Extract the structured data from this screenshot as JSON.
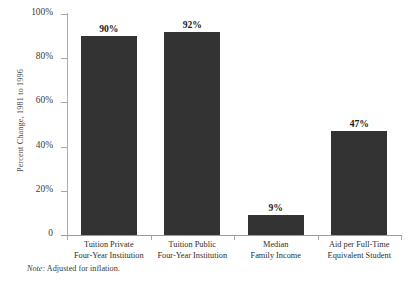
{
  "chart_data": {
    "type": "bar",
    "title": "",
    "subtitle": "",
    "xlabel": "",
    "ylabel": "Percent Change, 1981 to 1996",
    "ylim": [
      0,
      100
    ],
    "grid": false,
    "legend": false,
    "bar_color": "#333333",
    "axis_color": "#9a9a9a",
    "categories": [
      "Tuition Private Four-Year Institution",
      "Tuition Public Four-Year Institution",
      "Median Family Income",
      "Aid per Full-Time Equivalent Student"
    ],
    "category_lines": [
      [
        "Tuition Private",
        "Four-Year Institution"
      ],
      [
        "Tuition Public",
        "Four-Year Institution"
      ],
      [
        "Median",
        "Family Income"
      ],
      [
        "Aid per Full-Time",
        "Equivalent Student"
      ]
    ],
    "values": [
      90,
      92,
      9,
      47
    ],
    "value_labels": [
      "90%",
      "92%",
      "9%",
      "47%"
    ],
    "yticks": [
      0,
      20,
      40,
      60,
      80,
      100
    ],
    "ytick_labels": [
      "0",
      "20%",
      "40%",
      "60%",
      "80%",
      "100%"
    ]
  },
  "note": {
    "prefix": "Note:",
    "text": "Adjusted for inflation."
  }
}
